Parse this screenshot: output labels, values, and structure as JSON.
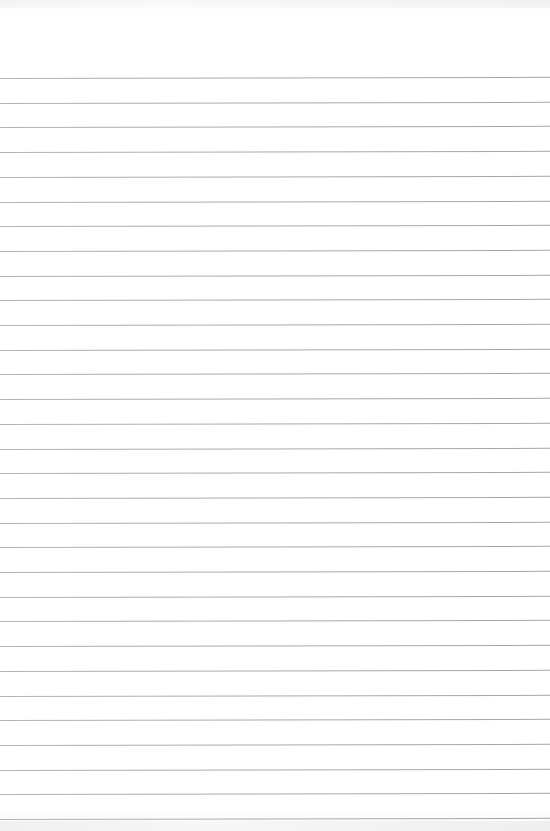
{
  "sheet": {
    "type": "lined-paper",
    "line_count": 31,
    "line_color": "#aaaaaa",
    "paper_color": "#ffffff",
    "text": ""
  }
}
